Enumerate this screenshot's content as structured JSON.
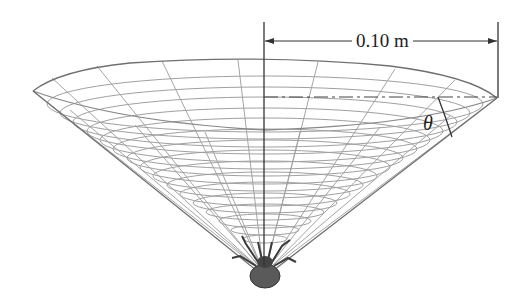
{
  "figure": {
    "dimension": {
      "label": "0.10 m",
      "meaning": "radius from axis to rim"
    },
    "angle": {
      "label": "θ"
    },
    "colors": {
      "web_lines": "#9a9a9a",
      "outline": "#6e6e6e",
      "dimension_lines": "#333333",
      "spider": "#555555"
    }
  }
}
